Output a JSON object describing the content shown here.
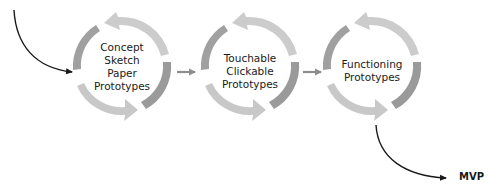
{
  "diagram": {
    "type": "iterative-prototyping-flow",
    "stages": [
      {
        "id": "stage-1",
        "lines": [
          "Concept",
          "Sketch",
          "Paper",
          "Prototypes"
        ]
      },
      {
        "id": "stage-2",
        "lines": [
          "Touchable",
          "Clickable",
          "Prototypes"
        ]
      },
      {
        "id": "stage-3",
        "lines": [
          "Functioning",
          "Prototypes"
        ]
      }
    ],
    "output_label": "MVP",
    "colors": {
      "arrow_light": "#c8c8c8",
      "arrow_dark": "#9a9a9a",
      "connector": "#8c8c8c",
      "flow_line": "#1a1a1a",
      "text": "#1a1a1a"
    },
    "connectors": [
      {
        "from": "stage-1",
        "to": "stage-2"
      },
      {
        "from": "stage-2",
        "to": "stage-3"
      },
      {
        "from": "stage-3",
        "to": "output"
      }
    ]
  }
}
